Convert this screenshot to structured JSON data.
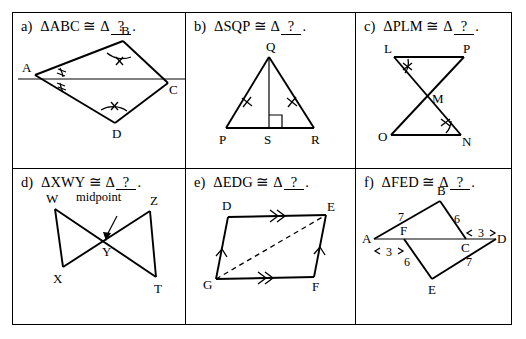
{
  "worksheet": {
    "title": "Congruent Triangles Worksheet",
    "blank_text": "?",
    "congruence_symbol": "≅",
    "delta": "Δ",
    "period": "."
  },
  "panels": [
    {
      "id": "a",
      "label": "a)",
      "statement": "ΔABC",
      "target_prefix": "Δ",
      "figure": {
        "name": "kite-abc-d",
        "vertices": [
          "A",
          "B",
          "C",
          "D"
        ],
        "marks": [
          "angle-arc-double-tick-at-A-upper",
          "angle-arc-double-tick-at-A-lower",
          "angle-arc-single-tick-at-B",
          "angle-arc-single-tick-at-D"
        ],
        "description": "Kite with horizontal diagonal A to C, vertex B above and vertex D below"
      }
    },
    {
      "id": "b",
      "label": "b)",
      "statement": "ΔSQP",
      "target_prefix": "Δ",
      "figure": {
        "name": "isosceles-triangle-pqr-altitude-qs",
        "vertices": [
          "Q",
          "P",
          "S",
          "R"
        ],
        "marks": [
          "single-tick-on-QP",
          "single-tick-on-QR",
          "right-angle-at-S"
        ],
        "description": "Isosceles triangle PQR with apex Q and altitude QS to base PR"
      }
    },
    {
      "id": "c",
      "label": "c)",
      "statement": "ΔPLM",
      "target_prefix": "Δ",
      "figure": {
        "name": "bowtie-lpon-crossing-at-m",
        "vertices": [
          "L",
          "P",
          "M",
          "O",
          "N"
        ],
        "marks": [
          "angle-arc-single-tick-at-L",
          "angle-arc-single-tick-at-N"
        ],
        "description": "Two triangles LMP and OMN meeting at crossing point M"
      }
    },
    {
      "id": "d",
      "label": "d)",
      "statement": "ΔXWY",
      "target_prefix": "Δ",
      "figure": {
        "name": "bowtie-wxzt-midpoint-y",
        "vertices": [
          "W",
          "X",
          "Y",
          "Z",
          "T"
        ],
        "annotation": "midpoint",
        "marks": [
          "midpoint-arrow-to-Y"
        ],
        "description": "Two triangles WXY and ZTY meeting at midpoint Y"
      }
    },
    {
      "id": "e",
      "label": "e)",
      "statement": "ΔEDG",
      "target_prefix": "Δ",
      "figure": {
        "name": "parallelogram-defg-diagonal-ge",
        "vertices": [
          "D",
          "E",
          "G",
          "F"
        ],
        "marks": [
          "double-arrow-on-DE",
          "double-arrow-on-GF",
          "single-arrow-on-GD",
          "single-arrow-on-FE",
          "dashed-diagonal-G-to-E"
        ],
        "description": "Parallelogram DEFG with dashed diagonal from G to E"
      }
    },
    {
      "id": "f",
      "label": "f)",
      "statement": "ΔFED",
      "target_prefix": "Δ",
      "figure": {
        "name": "overlapping-triangles-abf-ecd",
        "vertices": [
          "A",
          "B",
          "C",
          "D",
          "E",
          "F"
        ],
        "measures": [
          {
            "segment": "AB",
            "value": "7"
          },
          {
            "segment": "BC",
            "value": "6"
          },
          {
            "segment": "AF",
            "value": "3"
          },
          {
            "segment": "CD",
            "value": "3"
          },
          {
            "segment": "FE",
            "value": "6"
          },
          {
            "segment": "ED",
            "value": "7"
          }
        ],
        "description": "Horizontal line A F C D with triangle ABC above and triangle FED below"
      }
    }
  ]
}
